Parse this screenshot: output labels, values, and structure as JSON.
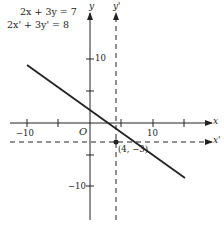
{
  "equations": {
    "original": "2x + 3y = 7",
    "translated": "2x' + 3y' = 8"
  },
  "axes": {
    "x_label": "x",
    "y_label": "y",
    "x_prime_label": "x'",
    "y_prime_label": "y'",
    "origin_label": "O"
  },
  "ticks": {
    "x_neg": "−10",
    "x_pos": "10",
    "y_pos": "10",
    "y_neg": "−10"
  },
  "point": {
    "label": "(4, −3)",
    "x": 4,
    "y": -3
  },
  "colors": {
    "ink": "#222222",
    "background": "#ffffff"
  }
}
